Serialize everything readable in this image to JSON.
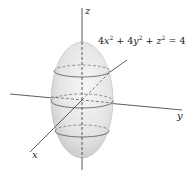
{
  "figure": {
    "equation": {
      "a": "4",
      "x": "x",
      "b": "4",
      "y": "y",
      "z": "z",
      "exp": "2",
      "plus": "+",
      "equals": "=",
      "rhs": "4"
    },
    "axes": {
      "x_label": "x",
      "y_label": "y",
      "z_label": "z"
    },
    "surface": "ellipsoid",
    "colors": {
      "surface_light": "#f2f2f2",
      "surface_dark": "#c8c8c8",
      "lines": "#333333"
    }
  }
}
